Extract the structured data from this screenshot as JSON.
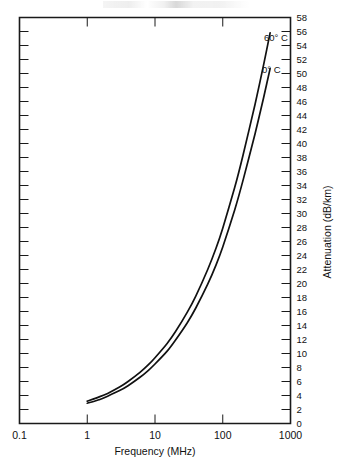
{
  "chart_data": {
    "type": "line",
    "title": "",
    "xlabel": "Frequency  (MHz)",
    "ylabel": "Attenuation  (dB/km)",
    "xscale": "log",
    "yscale": "linear",
    "xlim": [
      0.1,
      1000
    ],
    "ylim": [
      0,
      58
    ],
    "grid": false,
    "legend_position": "inline-right",
    "xticks": [
      0.1,
      1,
      10,
      100,
      1000
    ],
    "xtick_labels": [
      "0.1",
      "1",
      "10",
      "100",
      "1000"
    ],
    "yticks": [
      0,
      2,
      4,
      6,
      8,
      10,
      12,
      14,
      16,
      18,
      20,
      22,
      24,
      26,
      28,
      30,
      32,
      34,
      36,
      38,
      40,
      42,
      44,
      46,
      48,
      50,
      52,
      54,
      56,
      58
    ],
    "ytick_labels": [
      "0",
      "2",
      "4",
      "6",
      "8",
      "10",
      "12",
      "14",
      "16",
      "18",
      "20",
      "22",
      "24",
      "26",
      "28",
      "30",
      "32",
      "34",
      "36",
      "38",
      "40",
      "42",
      "44",
      "46",
      "48",
      "50",
      "52",
      "54",
      "56",
      "58"
    ],
    "series": [
      {
        "name": "60° C",
        "label": "60° C",
        "color": "#111111",
        "x": [
          1,
          1.5,
          2,
          3,
          4,
          6,
          8,
          10,
          15,
          20,
          30,
          40,
          60,
          80,
          100,
          150,
          200,
          300,
          400,
          500
        ],
        "values": [
          3.2,
          3.8,
          4.3,
          5.2,
          6.0,
          7.3,
          8.4,
          9.4,
          11.4,
          13.1,
          15.9,
          18.2,
          22.0,
          25.1,
          27.9,
          33.7,
          38.4,
          45.6,
          51.2,
          55.8
        ]
      },
      {
        "name": "0° C",
        "label": "0° C",
        "color": "#111111",
        "x": [
          1,
          1.5,
          2,
          3,
          4,
          6,
          8,
          10,
          15,
          20,
          30,
          40,
          60,
          80,
          100,
          150,
          200,
          300,
          400,
          500
        ],
        "values": [
          2.9,
          3.4,
          3.9,
          4.7,
          5.4,
          6.6,
          7.6,
          8.5,
          10.3,
          11.9,
          14.4,
          16.5,
          19.9,
          22.7,
          25.2,
          30.5,
          34.8,
          41.4,
          46.5,
          50.7
        ]
      }
    ],
    "annotations": [
      {
        "text": "60° C",
        "x_px": 264,
        "y_px": 41
      },
      {
        "text": "0° C",
        "x_px": 262,
        "y_px": 73
      }
    ]
  },
  "axes": {
    "x_title": "Frequency  (MHz)",
    "y_title": "Attenuation  (dB/km)"
  }
}
